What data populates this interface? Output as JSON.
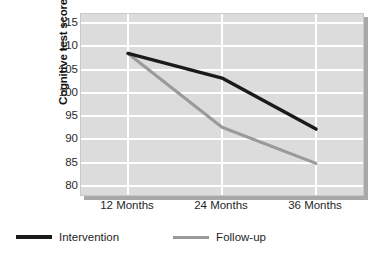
{
  "chart_data": {
    "type": "line",
    "title": "",
    "xlabel": "",
    "ylabel": "Cognitive test score",
    "categories": [
      "12 Months",
      "24 Months",
      "36 Months"
    ],
    "ylim": [
      78,
      117
    ],
    "yticks": [
      80,
      85,
      90,
      95,
      100,
      105,
      110,
      115
    ],
    "ytick_labels": [
      "80",
      "85",
      "90",
      "95",
      "100",
      "105",
      "110",
      "115"
    ],
    "grid": true,
    "legend_position": "bottom-left",
    "series": [
      {
        "name": "Intervention",
        "color": "#1a1a1a",
        "values": [
          108.5,
          103.2,
          92.2
        ]
      },
      {
        "name": "Follow-up",
        "color": "#9a9a9a",
        "values": [
          108.5,
          92.6,
          84.8
        ]
      }
    ]
  },
  "axis": {
    "y_title": "Cognitive test score"
  },
  "legend": {
    "items": [
      {
        "label": "Intervention",
        "color": "#1a1a1a"
      },
      {
        "label": "Follow-up",
        "color": "#9a9a9a"
      }
    ]
  },
  "colors": {
    "plot_background": "#dcdcdc",
    "gridline": "#ffffff",
    "shadow": "#a8a8a8",
    "intervention": "#1a1a1a",
    "follow_up": "#9a9a9a"
  }
}
